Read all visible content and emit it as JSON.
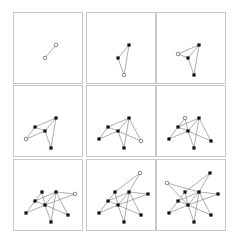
{
  "figure": {
    "colors": {
      "panel_border": "#c8c8c8",
      "edge": "#8a8a8a",
      "node_filled": "#111111",
      "node_hollow_stroke": "#555555",
      "background": "#ffffff"
    },
    "nodes": {
      "D": [
        42,
        32
      ],
      "G": [
        31,
        45
      ],
      "J": [
        37,
        62
      ],
      "C": [
        21,
        41
      ],
      "H": [
        12,
        53
      ],
      "I": [
        54,
        55
      ],
      "K": [
        28,
        32
      ],
      "E": [
        61,
        34
      ],
      "B": [
        53,
        13
      ],
      "A": [
        10,
        23
      ]
    },
    "panels": [
      {
        "pos": [
          13,
          12
        ],
        "nodes": [
          "D",
          "G"
        ],
        "new": [
          "D",
          "G"
        ],
        "edges": [
          [
            "D",
            "G"
          ]
        ]
      },
      {
        "pos": [
          86,
          12
        ],
        "nodes": [
          "D",
          "G",
          "J"
        ],
        "new": [
          "J"
        ],
        "edges": [
          [
            "D",
            "G"
          ],
          [
            "J",
            "D"
          ],
          [
            "J",
            "G"
          ]
        ]
      },
      {
        "pos": [
          156,
          12
        ],
        "nodes": [
          "D",
          "G",
          "J",
          "C"
        ],
        "new": [
          "C"
        ],
        "edges": [
          [
            "D",
            "G"
          ],
          [
            "J",
            "D"
          ],
          [
            "J",
            "G"
          ],
          [
            "C",
            "D"
          ],
          [
            "C",
            "G"
          ]
        ]
      },
      {
        "pos": [
          13,
          85
        ],
        "nodes": [
          "D",
          "G",
          "J",
          "C",
          "H"
        ],
        "new": [
          "H"
        ],
        "edges": [
          [
            "D",
            "G"
          ],
          [
            "J",
            "D"
          ],
          [
            "J",
            "G"
          ],
          [
            "C",
            "D"
          ],
          [
            "C",
            "G"
          ],
          [
            "H",
            "C"
          ],
          [
            "H",
            "G"
          ]
        ]
      },
      {
        "pos": [
          86,
          85
        ],
        "nodes": [
          "D",
          "G",
          "J",
          "C",
          "H",
          "I"
        ],
        "new": [
          "I"
        ],
        "edges": [
          [
            "D",
            "G"
          ],
          [
            "J",
            "D"
          ],
          [
            "J",
            "G"
          ],
          [
            "C",
            "D"
          ],
          [
            "C",
            "G"
          ],
          [
            "H",
            "C"
          ],
          [
            "H",
            "G"
          ],
          [
            "I",
            "D"
          ],
          [
            "I",
            "G"
          ]
        ]
      },
      {
        "pos": [
          156,
          85
        ],
        "nodes": [
          "D",
          "G",
          "J",
          "C",
          "H",
          "I",
          "K"
        ],
        "new": [
          "K"
        ],
        "edges": [
          [
            "D",
            "G"
          ],
          [
            "J",
            "D"
          ],
          [
            "J",
            "G"
          ],
          [
            "C",
            "D"
          ],
          [
            "C",
            "G"
          ],
          [
            "H",
            "C"
          ],
          [
            "H",
            "G"
          ],
          [
            "I",
            "D"
          ],
          [
            "I",
            "G"
          ],
          [
            "K",
            "C"
          ],
          [
            "K",
            "G"
          ]
        ]
      },
      {
        "pos": [
          13,
          159
        ],
        "nodes": [
          "D",
          "G",
          "J",
          "C",
          "H",
          "I",
          "K",
          "E"
        ],
        "new": [
          "E"
        ],
        "edges": [
          [
            "D",
            "G"
          ],
          [
            "J",
            "D"
          ],
          [
            "J",
            "G"
          ],
          [
            "C",
            "D"
          ],
          [
            "C",
            "G"
          ],
          [
            "H",
            "C"
          ],
          [
            "H",
            "G"
          ],
          [
            "I",
            "D"
          ],
          [
            "I",
            "G"
          ],
          [
            "K",
            "C"
          ],
          [
            "K",
            "G"
          ],
          [
            "E",
            "D"
          ],
          [
            "E",
            "G"
          ]
        ]
      },
      {
        "pos": [
          86,
          159
        ],
        "nodes": [
          "D",
          "G",
          "J",
          "C",
          "H",
          "I",
          "K",
          "E",
          "B"
        ],
        "new": [
          "B"
        ],
        "edges": [
          [
            "D",
            "G"
          ],
          [
            "J",
            "D"
          ],
          [
            "J",
            "G"
          ],
          [
            "C",
            "D"
          ],
          [
            "C",
            "G"
          ],
          [
            "H",
            "C"
          ],
          [
            "H",
            "G"
          ],
          [
            "I",
            "D"
          ],
          [
            "I",
            "G"
          ],
          [
            "K",
            "C"
          ],
          [
            "K",
            "G"
          ],
          [
            "E",
            "D"
          ],
          [
            "E",
            "G"
          ],
          [
            "B",
            "K"
          ],
          [
            "B",
            "D"
          ]
        ]
      },
      {
        "pos": [
          156,
          159
        ],
        "nodes": [
          "D",
          "G",
          "J",
          "C",
          "H",
          "I",
          "K",
          "E",
          "B",
          "A"
        ],
        "new": [
          "A"
        ],
        "edges": [
          [
            "D",
            "G"
          ],
          [
            "J",
            "D"
          ],
          [
            "J",
            "G"
          ],
          [
            "C",
            "D"
          ],
          [
            "C",
            "G"
          ],
          [
            "H",
            "C"
          ],
          [
            "H",
            "G"
          ],
          [
            "I",
            "D"
          ],
          [
            "I",
            "G"
          ],
          [
            "K",
            "C"
          ],
          [
            "K",
            "G"
          ],
          [
            "E",
            "D"
          ],
          [
            "E",
            "G"
          ],
          [
            "B",
            "K"
          ],
          [
            "B",
            "D"
          ],
          [
            "A",
            "D"
          ],
          [
            "A",
            "G"
          ]
        ]
      }
    ]
  }
}
